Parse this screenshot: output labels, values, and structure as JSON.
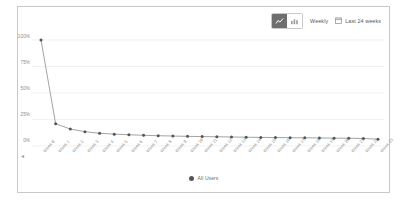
{
  "toolbar": {
    "chart_type_line_icon": "line-chart-icon",
    "chart_type_bar_icon": "bar-chart-icon",
    "granularity_label": "Weekly",
    "range_icon": "calendar-icon",
    "range_label": "Last 24 weeks"
  },
  "legend": {
    "series_label": "All Users",
    "marker_color": "#555555"
  },
  "colors": {
    "line": "#8c8c8c",
    "marker": "#555555",
    "grid": "#ededed",
    "axis_text": "#8a8a8a",
    "card_border": "#c8c8c8",
    "active_toggle": "#6e6e6e"
  },
  "chart_data": {
    "type": "line",
    "title": "",
    "xlabel": "",
    "ylabel": "",
    "ylim": [
      0,
      100
    ],
    "yticks": [
      0,
      25,
      50,
      75,
      100
    ],
    "ytick_labels": [
      "0%",
      "25%",
      "50%",
      "75%",
      "100%"
    ],
    "grid": true,
    "legend_position": "bottom",
    "categories": [
      "Week 0",
      "Week 1",
      "Week 2",
      "Week 3",
      "Week 4",
      "Week 5",
      "Week 6",
      "Week 7",
      "Week 8",
      "Week 9",
      "Week 10",
      "Week 11",
      "Week 12",
      "Week 13",
      "Week 14",
      "Week 15",
      "Week 16",
      "Week 17",
      "Week 18",
      "Week 19",
      "Week 20",
      "Week 21",
      "Week 22",
      "Week 23"
    ],
    "series": [
      {
        "name": "All Users",
        "values": [
          100,
          21,
          16,
          13.5,
          12,
          11.2,
          10.6,
          10.1,
          9.7,
          9.4,
          9.1,
          8.9,
          8.7,
          8.5,
          8.3,
          8.1,
          8.0,
          7.8,
          7.7,
          7.6,
          7.4,
          7.3,
          7.1,
          6.4
        ]
      }
    ]
  }
}
